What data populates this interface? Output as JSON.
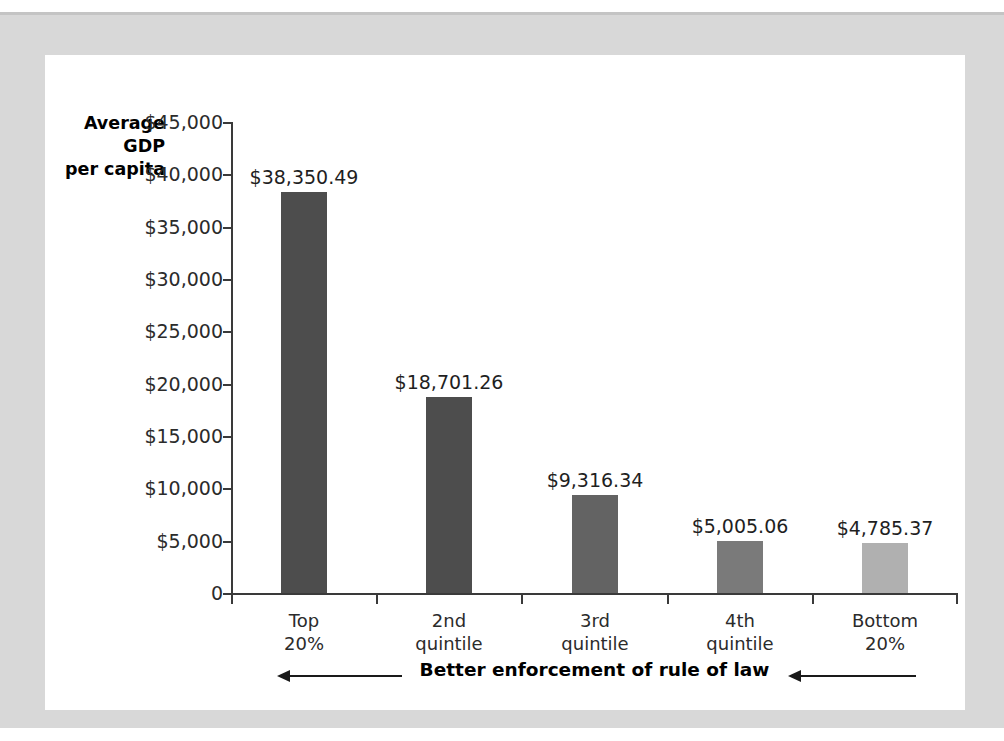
{
  "chart_data": {
    "type": "bar",
    "title": "",
    "subtitle": "",
    "xlabel": "Better enforcement of rule of law",
    "ylabel": "Average\nGDP\nper capita",
    "ylabel_lines": [
      "Average",
      "GDP",
      "per capita"
    ],
    "categories": [
      "Top 20%",
      "2nd quintile",
      "3rd quintile",
      "4th quintile",
      "Bottom 20%"
    ],
    "category_lines": [
      [
        "Top",
        "20%"
      ],
      [
        "2nd",
        "quintile"
      ],
      [
        "3rd",
        "quintile"
      ],
      [
        "4th",
        "quintile"
      ],
      [
        "Bottom",
        "20%"
      ]
    ],
    "values": [
      38350.49,
      18701.26,
      9316.34,
      5005.06,
      4785.37
    ],
    "value_labels": [
      "$38,350.49",
      "$18,701.26",
      "$9,316.34",
      "$5,005.06",
      "$4,785.37"
    ],
    "bar_colors": [
      "#4d4d4d",
      "#4d4d4d",
      "#636363",
      "#7a7a7a",
      "#b0b0b0"
    ],
    "ylim": [
      0,
      45000
    ],
    "ytick_values": [
      45000,
      40000,
      35000,
      30000,
      25000,
      20000,
      15000,
      10000,
      5000,
      0
    ],
    "ytick_labels": [
      "$45,000",
      "$40,000",
      "$35,000",
      "$30,000",
      "$25,000",
      "$20,000",
      "$15,000",
      "$10,000",
      "$5,000",
      "0"
    ],
    "grid": false,
    "legend": null,
    "legend_position": "none",
    "annotations": [
      {
        "text": "Better enforcement of rule of law",
        "left_arrow_direction": "left",
        "right_arrow_direction": "left"
      }
    ]
  },
  "figure": {
    "page_background": "#ffffff",
    "mat_color": "#d8d8d8",
    "panel_color": "#ffffff",
    "axis_color": "#3a3a3a",
    "text_color": "#2b2b2b"
  }
}
